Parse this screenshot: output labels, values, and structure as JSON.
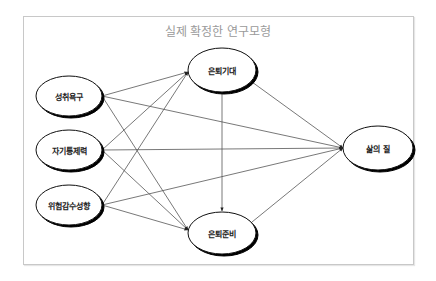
{
  "diagram": {
    "title": "실제 확정한 연구모형",
    "nodes": {
      "achievement_need": {
        "label": "성취욕구"
      },
      "self_control": {
        "label": "자기통제력"
      },
      "risk_sensitivity": {
        "label": "위험감수성향"
      },
      "retirement_expectation": {
        "label": "은퇴기대"
      },
      "retirement_preparation": {
        "label": "은퇴준비"
      },
      "quality_of_life": {
        "label": "삶의 질"
      }
    },
    "edges": [
      {
        "from": "성취욕구",
        "to": "은퇴기대"
      },
      {
        "from": "성취욕구",
        "to": "은퇴준비"
      },
      {
        "from": "성취욕구",
        "to": "삶의 질"
      },
      {
        "from": "자기통제력",
        "to": "은퇴기대"
      },
      {
        "from": "자기통제력",
        "to": "은퇴준비"
      },
      {
        "from": "자기통제력",
        "to": "삶의 질"
      },
      {
        "from": "위험감수성향",
        "to": "은퇴기대"
      },
      {
        "from": "위험감수성향",
        "to": "은퇴준비"
      },
      {
        "from": "위험감수성향",
        "to": "삶의 질"
      },
      {
        "from": "은퇴기대",
        "to": "은퇴준비"
      },
      {
        "from": "은퇴기대",
        "to": "삶의 질"
      },
      {
        "from": "은퇴준비",
        "to": "삶의 질"
      }
    ],
    "colors": {
      "frame_border": "#c8c8c8",
      "title_text": "#9a9a9a",
      "edge": "#555555",
      "node_outline": "#111111"
    }
  }
}
